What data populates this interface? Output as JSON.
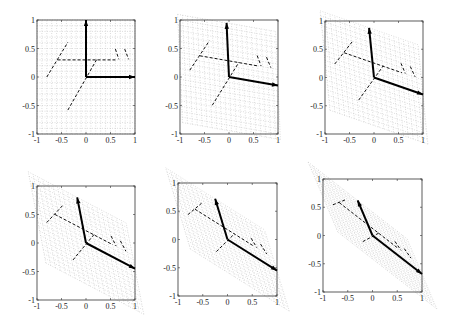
{
  "chart_data": [
    {
      "panel": 1,
      "type": "line",
      "title": "",
      "xlim": [
        -1,
        1
      ],
      "ylim": [
        -1,
        1
      ],
      "e1": [
        1,
        0
      ],
      "e2": [
        0,
        1
      ],
      "box": [
        37,
        20,
        98,
        114
      ]
    },
    {
      "panel": 2,
      "type": "line",
      "title": "",
      "xlim": [
        -1,
        1
      ],
      "ylim": [
        -1,
        1
      ],
      "e1": [
        1,
        -0.15
      ],
      "e2": [
        -0.05,
        0.95
      ],
      "box": [
        180,
        20,
        98,
        114
      ]
    },
    {
      "panel": 3,
      "type": "line",
      "title": "",
      "xlim": [
        -1,
        1
      ],
      "ylim": [
        -1,
        1
      ],
      "e1": [
        1,
        -0.3
      ],
      "e2": [
        -0.1,
        0.88
      ],
      "box": [
        325,
        21,
        98,
        113
      ]
    },
    {
      "panel": 4,
      "type": "line",
      "title": "",
      "xlim": [
        -1,
        1
      ],
      "ylim": [
        -1,
        1
      ],
      "e1": [
        1,
        -0.45
      ],
      "e2": [
        -0.18,
        0.8
      ],
      "box": [
        37,
        186,
        98,
        114
      ]
    },
    {
      "panel": 5,
      "type": "line",
      "title": "",
      "xlim": [
        -1,
        1
      ],
      "ylim": [
        -1,
        1
      ],
      "e1": [
        1,
        -0.55
      ],
      "e2": [
        -0.25,
        0.72
      ],
      "box": [
        178,
        183,
        99,
        113
      ]
    },
    {
      "panel": 6,
      "type": "line",
      "title": "",
      "xlim": [
        -1,
        1
      ],
      "ylim": [
        -1,
        1
      ],
      "e1": [
        1,
        -0.68
      ],
      "e2": [
        -0.3,
        0.62
      ],
      "box": [
        323,
        179,
        99,
        113
      ]
    }
  ],
  "shape_segments": [
    [
      [
        -0.8,
        0.0
      ],
      [
        -0.37,
        0.61
      ]
    ],
    [
      [
        -0.58,
        0.3
      ],
      [
        0.6,
        0.3
      ]
    ],
    [
      [
        -0.37,
        -0.58
      ],
      [
        0.22,
        0.31
      ]
    ],
    [
      [
        0.6,
        0.49
      ],
      [
        0.67,
        0.31
      ]
    ],
    [
      [
        0.79,
        0.49
      ],
      [
        0.87,
        0.31
      ]
    ]
  ],
  "xticks": [
    "-1",
    "-0.5",
    "0",
    "0.5",
    "1"
  ],
  "yticks": [
    "-1",
    "-0.5",
    "0",
    "0.5",
    "1"
  ],
  "xtick_values": [
    -1,
    -0.5,
    0,
    0.5,
    1
  ],
  "ytick_values": [
    -1,
    -0.5,
    0,
    0.5,
    1
  ],
  "grid": {
    "step": 0.1,
    "range": [
      -1,
      1
    ]
  },
  "colors": {
    "axis": "#333333",
    "grid": "#bbbbbb",
    "vector": "#000000",
    "shape": "#111111"
  }
}
